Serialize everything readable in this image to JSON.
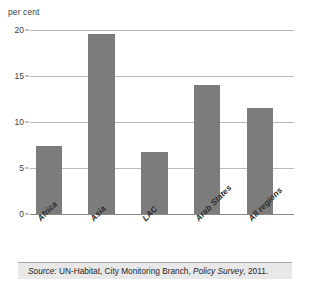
{
  "chart_data": {
    "type": "bar",
    "title": "",
    "subtitle": "",
    "xlabel": "",
    "ylabel": "per cent",
    "categories": [
      "Africa",
      "Asia",
      "LAC",
      "Arab States",
      "All regions"
    ],
    "values": [
      7.4,
      19.5,
      6.7,
      14.0,
      11.5
    ],
    "series": [
      {
        "name": "per cent",
        "values": [
          7.4,
          19.5,
          6.7,
          14.0,
          11.5
        ]
      }
    ],
    "ylim": [
      0,
      20
    ],
    "yticks": [
      0,
      5,
      10,
      15,
      20
    ],
    "ytick_labels": [
      "0",
      "5",
      "10",
      "15",
      "20"
    ],
    "grid": "horizontal",
    "legend": "none",
    "bar_color": "#7c7c7c",
    "gridline_color": "#b9b9b9",
    "axis_color": "#8a8a8a",
    "background_color": "#ffffff"
  },
  "axis": {
    "unit_label": "per cent"
  },
  "source": {
    "lead": "Source:",
    "body_before": " UN-Habitat, City Monitoring Branch, ",
    "publication": "Policy Survey",
    "body_after": ", 2011.",
    "full_text": "Source: UN-Habitat, City Monitoring Branch, Policy Survey, 2011.",
    "band_color": "#e8e8e8"
  }
}
